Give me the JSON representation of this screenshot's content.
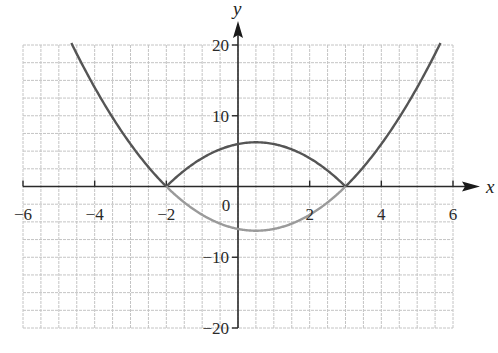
{
  "chart_data": {
    "type": "line",
    "title": "",
    "xlabel": "x",
    "ylabel": "y",
    "xlim": [
      -6,
      6
    ],
    "ylim": [
      -20,
      20
    ],
    "x_ticks": [
      -6,
      -4,
      -2,
      0,
      2,
      4,
      6
    ],
    "x_tick_labels": [
      "−6",
      "−4",
      "−2",
      "0",
      "2",
      "4",
      "6"
    ],
    "y_ticks": [
      -20,
      -10,
      10,
      20
    ],
    "y_tick_labels": [
      "−20",
      "−10",
      "10",
      "20"
    ],
    "grid": true,
    "grid_minor_x_step": 0.5,
    "grid_minor_y_step": 2.5,
    "legend": null,
    "series": [
      {
        "name": "y = |x² − x − 6|",
        "color": "#555555",
        "style": "solid",
        "x": [
          -4.65,
          -4.5,
          -4,
          -3.5,
          -3,
          -2.5,
          -2,
          -1.5,
          -1,
          -0.5,
          0,
          0.5,
          1,
          1.5,
          2,
          2.5,
          3,
          3.5,
          4,
          4.5,
          5,
          5.5,
          5.65
        ],
        "values": [
          20,
          18.75,
          14,
          9.75,
          6,
          2.75,
          0,
          2.25,
          4,
          5.25,
          6,
          6.25,
          6,
          5.25,
          4,
          2.25,
          0,
          2.75,
          6,
          9.75,
          14,
          18.75,
          20
        ]
      },
      {
        "name": "y = x² − x − 6",
        "color": "#9a9a9a",
        "style": "solid",
        "x": [
          -2,
          -1.5,
          -1,
          -0.5,
          0,
          0.5,
          1,
          1.5,
          2,
          2.5,
          3
        ],
        "values": [
          0,
          -2.25,
          -4,
          -5.25,
          -6,
          -6.25,
          -6,
          -5.25,
          -4,
          -2.25,
          0
        ]
      }
    ],
    "annotations": []
  }
}
